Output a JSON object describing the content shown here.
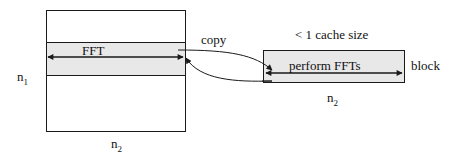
{
  "diagram": {
    "matrix": {
      "band_label": "FFT",
      "row_label": "n",
      "row_sub": "1",
      "col_label": "n",
      "col_sub": "2"
    },
    "copy_label": "copy",
    "block": {
      "title": "< 1 cache size",
      "inner_label": "perform FFTs",
      "side_label": "block",
      "col_label": "n",
      "col_sub": "2"
    },
    "colors": {
      "stroke": "#1a1a1a",
      "band_fill": "#e8e8e8"
    }
  }
}
